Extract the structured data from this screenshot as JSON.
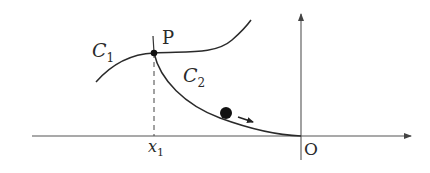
{
  "diagram": {
    "labels": {
      "curve1": "C",
      "curve1_sub": "1",
      "curve2": "C",
      "curve2_sub": "2",
      "point": "P",
      "x_tick": "x",
      "x_tick_sub": "1",
      "origin": "O"
    },
    "colors": {
      "stroke": "#2a2a2a",
      "axis": "#444444",
      "background": "#ffffff"
    }
  }
}
